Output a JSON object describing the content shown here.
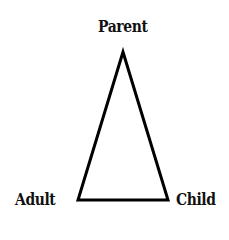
{
  "diagram": {
    "type": "triangle",
    "nodes": {
      "top": {
        "label": "Parent"
      },
      "bottom_left": {
        "label": "Adult"
      },
      "bottom_right": {
        "label": "Child"
      }
    },
    "stroke_color": "#000000"
  }
}
